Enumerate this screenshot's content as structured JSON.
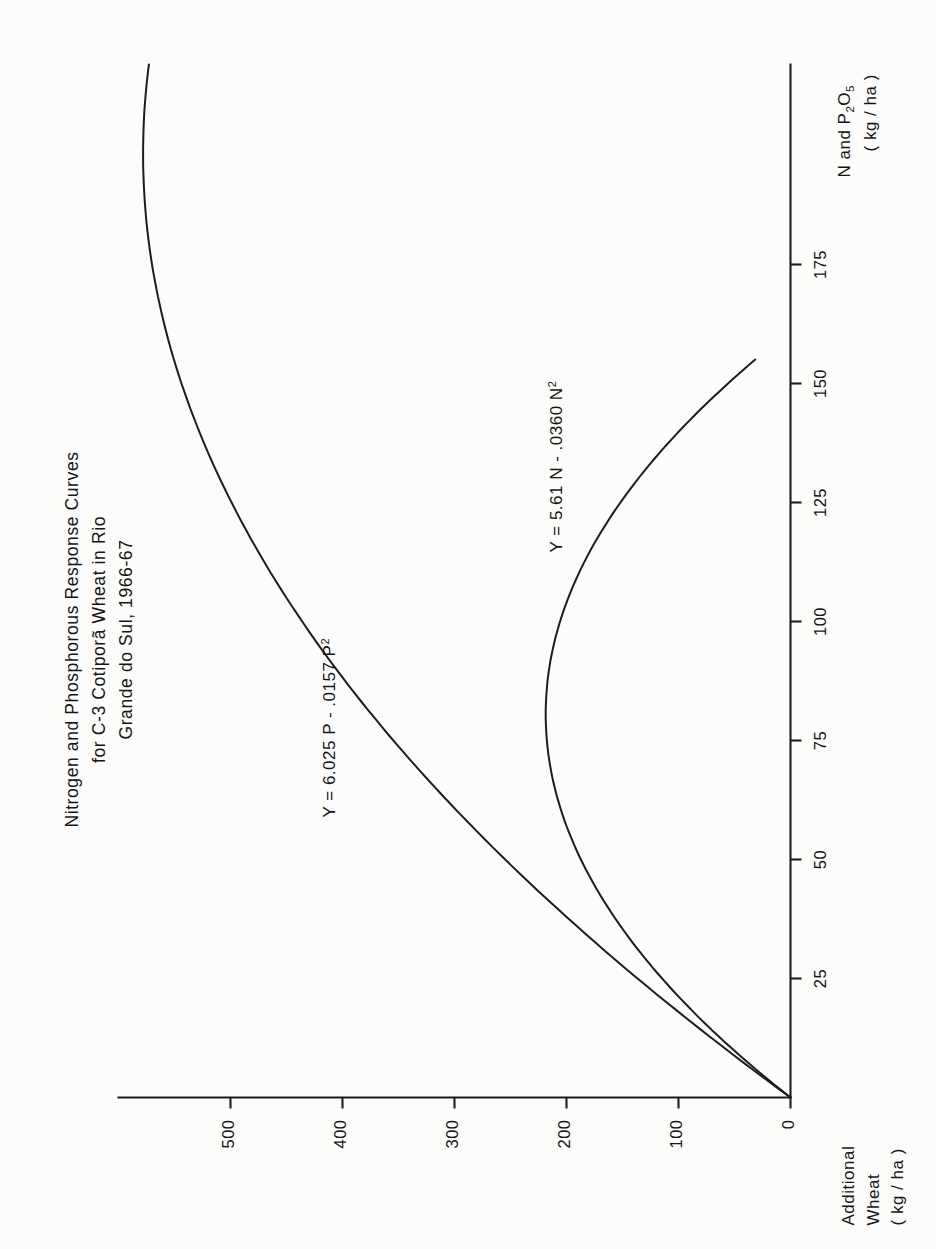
{
  "figure": {
    "title_lines": [
      "Nitrogen and Phosphorous Response Curves",
      "for C-3 Cotiporã Wheat in Rio",
      "Grande do Sul, 1966-67"
    ],
    "orientation": "rotated-90-ccw"
  },
  "annotations": {
    "phosphorus_equation": "Y = 6.025 P - .0157 P",
    "phosphorus_equation_exp": "2",
    "nitrogen_equation": "Y = 5.61 N - .0360 N",
    "nitrogen_equation_exp": "2"
  },
  "axes": {
    "y_label_lines": [
      "Additional",
      "Wheat",
      "( kg / ha )"
    ],
    "x_label_line1_a": "N and P",
    "x_label_line1_sub": "2",
    "x_label_line1_b": "O",
    "x_label_line1_sub2": "5",
    "x_label_line2": "( kg / ha )",
    "y_ticks": [
      "0",
      "100",
      "200",
      "300",
      "400",
      "500"
    ],
    "x_ticks": [
      "25",
      "50",
      "75",
      "100",
      "125",
      "150",
      "175"
    ]
  },
  "chart_data": {
    "type": "line",
    "title": "Nitrogen and Phosphorous Response Curves for C-3 Cotiporã Wheat in Rio Grande do Sul, 1966-67",
    "xlabel": "N and P2O5 (kg/ha)",
    "ylabel": "Additional Wheat (kg/ha)",
    "xlim": [
      0,
      210
    ],
    "ylim": [
      0,
      600
    ],
    "x_ticks": [
      25,
      50,
      75,
      100,
      125,
      150,
      175
    ],
    "y_ticks": [
      0,
      100,
      200,
      300,
      400,
      500
    ],
    "grid": false,
    "legend": "none",
    "series": [
      {
        "name": "Phosphorous response",
        "equation": "Y = 6.025 P - .0157 P^2",
        "coefficients": {
          "linear": 6.025,
          "quadratic": -0.0157
        },
        "x": [
          0,
          25,
          50,
          75,
          100,
          125,
          150,
          175,
          192,
          200,
          210
        ],
        "values": [
          0,
          141,
          262,
          364,
          445,
          508,
          550,
          573,
          578,
          577,
          572
        ]
      },
      {
        "name": "Nitrogen response",
        "equation": "Y = 5.61 N - .0360 N^2",
        "coefficients": {
          "linear": 5.61,
          "quadratic": -0.036
        },
        "x": [
          0,
          25,
          50,
          75,
          78,
          100,
          125,
          150
        ],
        "values": [
          0,
          118,
          191,
          218,
          219,
          201,
          139,
          31
        ]
      }
    ]
  }
}
